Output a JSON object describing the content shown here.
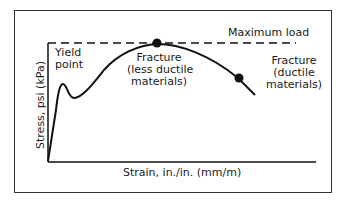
{
  "diagram": {
    "axes": {
      "xlabel": "Strain, in./in. (mm/m)",
      "ylabel": "Stress, psi (kPa)"
    },
    "annotations": {
      "max_load": "Maximum load",
      "yield_line1": "Yield",
      "yield_line2": "point",
      "fracture_less_line1": "Fracture",
      "fracture_less_line2": "(less ductile",
      "fracture_less_line3": "materials)",
      "fracture_ductile_line1": "Fracture",
      "fracture_ductile_line2": "(ductile",
      "fracture_ductile_line3": "materials)"
    },
    "colors": {
      "line": "#111111",
      "frame": "#333333"
    }
  }
}
